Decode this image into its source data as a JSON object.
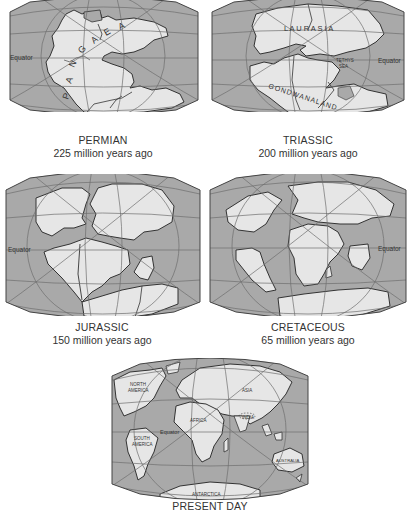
{
  "figure": {
    "colors": {
      "ocean": "#a9a9a9",
      "land": "#e6e6e6",
      "coast": "#333333",
      "grid": "#6f6f6f",
      "text": "#333333"
    }
  },
  "maps": [
    {
      "id": "permian",
      "era": "PERMIAN",
      "age": "225 million years ago",
      "labels": {
        "equator": "Equator",
        "supercontinent": [
          "P",
          "A",
          "N",
          "G",
          "A",
          "E",
          "A"
        ]
      }
    },
    {
      "id": "triassic",
      "era": "TRIASSIC",
      "age": "200 million years ago",
      "labels": {
        "equator": "Equator",
        "north": "L A U R A S I A",
        "south": "GONDWANALAND",
        "sea_line1": "TETHYS",
        "sea_line2": "SEA"
      }
    },
    {
      "id": "jurassic",
      "era": "JURASSIC",
      "age": "150 million years ago",
      "labels": {
        "equator": "Equator"
      }
    },
    {
      "id": "cretaceous",
      "era": "CRETACEOUS",
      "age": "65 million years ago",
      "labels": {
        "equator": "Equator"
      }
    },
    {
      "id": "present",
      "era": "PRESENT DAY",
      "age": "",
      "labels": {
        "equator": "Equator",
        "north_america": [
          "NORTH",
          "AMERICA"
        ],
        "south_america": [
          "SOUTH",
          "AMERICA"
        ],
        "africa": "AFRICA",
        "asia": "ASIA",
        "india": "INDIA",
        "australia": "AUSTRALIA",
        "antarctica": "ANTARCTICA"
      }
    }
  ]
}
